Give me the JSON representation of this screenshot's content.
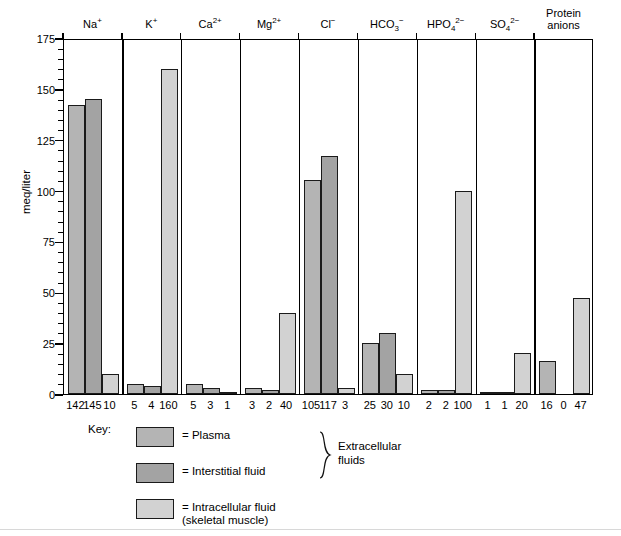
{
  "chart_data": {
    "type": "bar",
    "title": "",
    "xlabel": "",
    "ylabel": "meq/liter",
    "ylim": [
      0,
      175
    ],
    "ytick_step": 25,
    "yminor_step": 5,
    "grid": false,
    "legend_position": "below-plot",
    "ytick_labels": [
      "175",
      "150",
      "125",
      "100",
      "75",
      "50",
      "25",
      "0"
    ],
    "categories": [
      {
        "label_html": "Na<sup>+</sup>",
        "label_text": "Na+"
      },
      {
        "label_html": "K<sup>+</sup>",
        "label_text": "K+"
      },
      {
        "label_html": "Ca<sup>2+</sup>",
        "label_text": "Ca2+"
      },
      {
        "label_html": "Mg<sup>2+</sup>",
        "label_text": "Mg2+"
      },
      {
        "label_html": "Cl<sup>&#8722;</sup>",
        "label_text": "Cl-"
      },
      {
        "label_html": "HCO<sub>3</sub><sup>&#8722;</sup>",
        "label_text": "HCO3-"
      },
      {
        "label_html": "HPO<sub>4</sub><sup>2&#8722;</sup>",
        "label_text": "HPO42-"
      },
      {
        "label_html": "SO<sub>4</sub><sup>2&#8722;</sup>",
        "label_text": "SO42-"
      },
      {
        "label_html": "Protein<br>anions",
        "label_text": "Protein anions"
      }
    ],
    "series": [
      {
        "name": "Plasma",
        "key": "plasma",
        "color": "#b4b4b4",
        "values": [
          142,
          5,
          5,
          3,
          105,
          25,
          2,
          1,
          16
        ]
      },
      {
        "name": "Interstitial fluid",
        "key": "interstitial",
        "color": "#a3a3a3",
        "values": [
          145,
          4,
          3,
          2,
          117,
          30,
          2,
          1,
          0
        ]
      },
      {
        "name": "Intracellular fluid (skeletal muscle)",
        "key": "intracellular",
        "color": "#d2d2d2",
        "values": [
          10,
          160,
          1,
          40,
          3,
          10,
          100,
          20,
          47
        ]
      }
    ],
    "value_labels": [
      [
        "142",
        "145",
        "10"
      ],
      [
        "5",
        "4",
        "160"
      ],
      [
        "5",
        "3",
        "1"
      ],
      [
        "3",
        "2",
        "40"
      ],
      [
        "105",
        "117",
        "3"
      ],
      [
        "25",
        "30",
        "10"
      ],
      [
        "2",
        "2",
        "100"
      ],
      [
        "1",
        "1",
        "20"
      ],
      [
        "16",
        "0",
        "47"
      ]
    ]
  },
  "key": {
    "title": "Key:",
    "entries": [
      {
        "symbol": "=",
        "label": "= Plasma",
        "swatch": "plasma"
      },
      {
        "symbol": "=",
        "label": "= Interstitial fluid",
        "swatch": "interstitial"
      },
      {
        "symbol": "=",
        "label": "= Intracellular fluid\n(skeletal muscle)",
        "swatch": "intracellular"
      }
    ],
    "brace_label": "Extracellular\nfluids"
  }
}
